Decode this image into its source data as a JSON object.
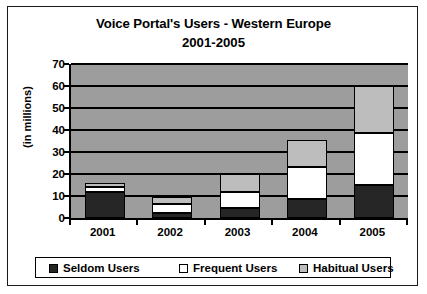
{
  "chart_data": {
    "type": "bar",
    "subtype": "stacked-bar",
    "title": "Voice Portal's Users - Western Europe",
    "subtitle": "2001-2005",
    "xlabel": "",
    "ylabel": "(in millions)",
    "ylim": [
      0,
      70
    ],
    "yticks": [
      0,
      10,
      20,
      30,
      40,
      50,
      60,
      70
    ],
    "grid": true,
    "legend_position": "bottom",
    "categories": [
      "2001",
      "2002",
      "2003",
      "2004",
      "2005"
    ],
    "series": [
      {
        "name": "Seldom Users",
        "color": "#262626",
        "values": [
          12,
          2.5,
          4.5,
          8.5,
          15
        ]
      },
      {
        "name": "Frequent Users",
        "color": "#ffffff",
        "values": [
          2,
          4,
          7.5,
          14.5,
          23.5
        ]
      },
      {
        "name": "Habitual Users",
        "color": "#bdbdbd",
        "values": [
          2,
          3,
          8,
          12.5,
          21.5
        ]
      }
    ],
    "totals": [
      16,
      9.5,
      20,
      35.5,
      60
    ],
    "plot_background": "#9d9d9d",
    "axis_color": "#000000"
  }
}
